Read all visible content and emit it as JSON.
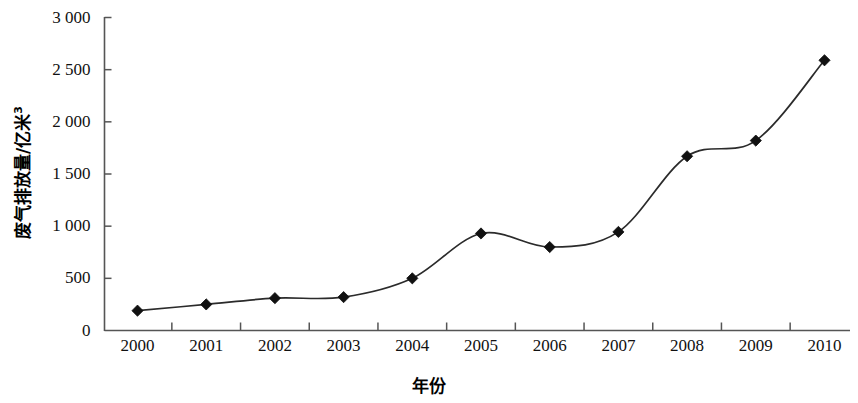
{
  "chart_data": {
    "type": "line",
    "title": "",
    "xlabel": "年份",
    "ylabel": "废气排放量/亿米³",
    "ylabel_base": "废气排放量/亿米",
    "ylabel_sup": "3",
    "categories": [
      "2000",
      "2001",
      "2002",
      "2003",
      "2004",
      "2005",
      "2006",
      "2007",
      "2008",
      "2009",
      "2010"
    ],
    "values": [
      190,
      250,
      310,
      320,
      500,
      930,
      800,
      945,
      1670,
      1820,
      2590
    ],
    "series": [
      {
        "name": "废气排放量",
        "values": [
          190,
          250,
          310,
          320,
          500,
          930,
          800,
          945,
          1670,
          1820,
          2590
        ]
      }
    ],
    "ylim": [
      0,
      3000
    ],
    "y_ticks": [
      0,
      500,
      1000,
      1500,
      2000,
      2500,
      3000
    ],
    "y_tick_labels": [
      "0",
      "500",
      "1 000",
      "1 500",
      "2 000",
      "2 500",
      "3 000"
    ],
    "x_tick_labels": [
      "2000",
      "2001",
      "2002",
      "2003",
      "2004",
      "2005",
      "2006",
      "2007",
      "2008",
      "2009",
      "2010"
    ],
    "grid": false,
    "legend": "none",
    "marker": "diamond",
    "line_color": "#2b2b2b",
    "marker_color": "#111111",
    "axis_color": "#555555",
    "smoothing": "spline"
  }
}
